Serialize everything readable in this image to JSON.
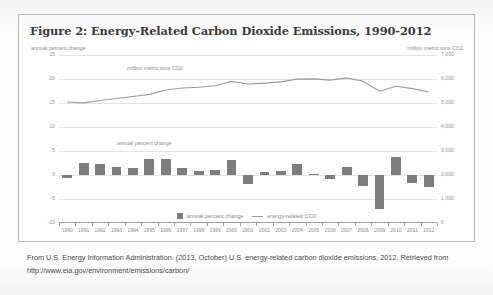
{
  "figure": {
    "title": "Figure 2: Energy-Related Carbon Dioxide Emissions, 1990-2012",
    "unit_left": "annual percent change",
    "unit_right": "million metric tons CO2",
    "annotation_line": "million metric tons CO2",
    "annotation_bars": "annual percent change"
  },
  "legend": {
    "bars_label": "annual percent change",
    "line_label": "energy-related CO2"
  },
  "caption": {
    "text": "From U.S. Energy Information Administration. (2013, October) U.S. energy-related carbon dioxide emissions, 2012. Retrieved from http://www.eia.gov/environment/emissions/carbon/"
  },
  "colors": {
    "bar": "#7d7d7d",
    "line": "#9b9b9b",
    "grid": "#e3e3e3",
    "frame": "#b9b9b9",
    "title": "#3a3a3a"
  },
  "chart_data": {
    "type": "bar",
    "title": "Figure 2: Energy-Related Carbon Dioxide Emissions, 1990-2012",
    "xlabel": "",
    "ylabel": "annual percent change",
    "y2label": "million metric tons CO2",
    "ylim": [
      -10,
      25
    ],
    "y2lim": [
      0,
      7000
    ],
    "yticks": [
      -10,
      -5,
      0,
      5,
      10,
      15,
      20,
      25
    ],
    "y2ticks": [
      "0",
      "1,000",
      "2,000",
      "3,000",
      "4,000",
      "5,000",
      "6,000",
      "7,000"
    ],
    "grid": true,
    "legend_position": "bottom",
    "categories": [
      "1990",
      "1991",
      "1992",
      "1993",
      "1994",
      "1995",
      "1996",
      "1997",
      "1998",
      "1999",
      "2000",
      "2001",
      "2002",
      "2003",
      "2004",
      "2005",
      "2006",
      "2007",
      "2008",
      "2009",
      "2010",
      "2011",
      "2012"
    ],
    "series": [
      {
        "name": "annual percent change",
        "type": "bar",
        "axis": "left",
        "unit": "percent",
        "values": [
          -0.7,
          2.5,
          2.3,
          1.6,
          1.5,
          3.3,
          3.3,
          1.4,
          0.9,
          1.1,
          3.2,
          -1.9,
          0.6,
          0.9,
          2.2,
          0.2,
          -0.9,
          1.7,
          -2.2,
          -7.0,
          3.8,
          -1.7,
          -2.4
        ]
      },
      {
        "name": "energy-related CO2",
        "type": "line",
        "axis": "right",
        "unit": "million metric tons CO2",
        "values": [
          5039,
          5005,
          5102,
          5189,
          5270,
          5360,
          5540,
          5625,
          5655,
          5720,
          5900,
          5790,
          5830,
          5880,
          5995,
          6005,
          5955,
          6045,
          5910,
          5490,
          5700,
          5600,
          5460
        ]
      }
    ]
  }
}
